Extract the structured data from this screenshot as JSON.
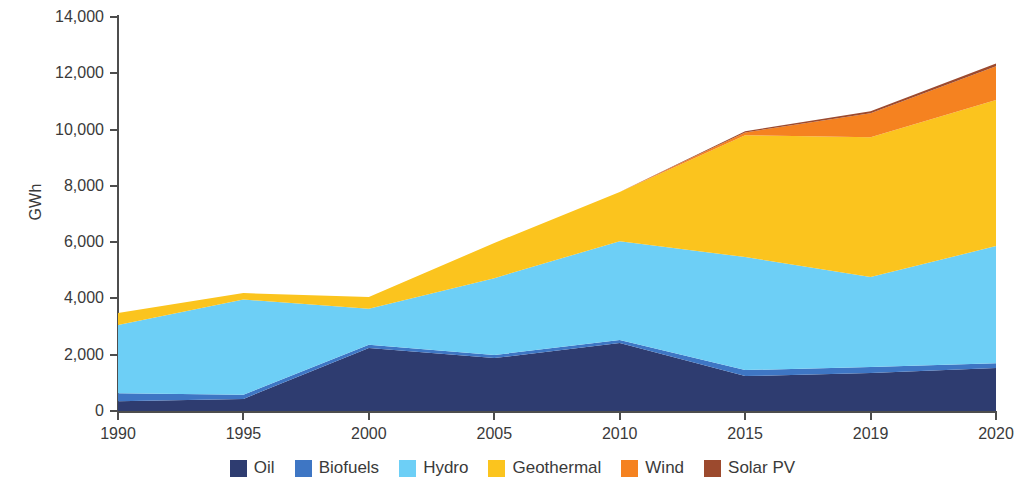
{
  "chart_data": {
    "type": "area",
    "stacked": true,
    "title": "",
    "subtitle": "",
    "xlabel": "",
    "ylabel": "GWh",
    "categories": [
      "1990",
      "1995",
      "2000",
      "2005",
      "2010",
      "2015",
      "2019",
      "2020"
    ],
    "ylim": [
      0,
      14000
    ],
    "ytick_step": 2000,
    "ytick_labels": [
      "0",
      "2,000",
      "4,000",
      "6,000",
      "8,000",
      "10,000",
      "12,000",
      "14,000"
    ],
    "ytick_values": [
      0,
      2000,
      4000,
      6000,
      8000,
      10000,
      12000,
      14000
    ],
    "grid": false,
    "legend_position": "bottom",
    "series": [
      {
        "name": "Oil",
        "color": "#2E3C70",
        "values": [
          350,
          430,
          2240,
          1880,
          2415,
          1240,
          1350,
          1530
        ]
      },
      {
        "name": "Biofuels",
        "color": "#3E76C4",
        "values": [
          280,
          150,
          110,
          110,
          105,
          215,
          210,
          170
        ]
      },
      {
        "name": "Hydro",
        "color": "#6DCFF6",
        "values": [
          2430,
          3380,
          1280,
          2730,
          3515,
          4015,
          3200,
          4160
        ]
      },
      {
        "name": "Geothermal",
        "color": "#FBC41E",
        "values": [
          420,
          230,
          420,
          1250,
          1745,
          4330,
          4970,
          5190
        ]
      },
      {
        "name": "Wind",
        "color": "#F58220",
        "values": [
          0,
          0,
          0,
          0,
          0,
          100,
          850,
          1200
        ]
      },
      {
        "name": "Solar PV",
        "color": "#9C4A2E",
        "values": [
          0,
          0,
          0,
          0,
          0,
          40,
          70,
          100
        ]
      }
    ],
    "totals": [
      3480,
      4190,
      4050,
      5970,
      7780,
      9940,
      10650,
      12350
    ]
  },
  "axis": {
    "y_title": "GWh"
  },
  "legend": {
    "items": [
      {
        "label": "Oil",
        "color": "#2E3C70"
      },
      {
        "label": "Biofuels",
        "color": "#3E76C4"
      },
      {
        "label": "Hydro",
        "color": "#6DCFF6"
      },
      {
        "label": "Geothermal",
        "color": "#FBC41E"
      },
      {
        "label": "Wind",
        "color": "#F58220"
      },
      {
        "label": "Solar PV",
        "color": "#9C4A2E"
      }
    ]
  }
}
